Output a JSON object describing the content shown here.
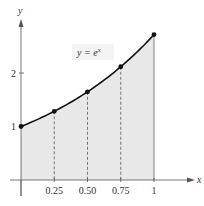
{
  "chart_data": {
    "type": "area",
    "title": "",
    "function_label": "y = e^x",
    "label_parts": {
      "lhs": "y = e",
      "sup": "x"
    },
    "xlabel": "x",
    "ylabel": "y",
    "x_ticks": [
      0.25,
      0.5,
      0.75,
      1
    ],
    "x_tick_labels": [
      "0.25",
      "0.50",
      "0.75",
      "1"
    ],
    "y_ticks": [
      1,
      2
    ],
    "y_tick_labels": [
      "1",
      "2"
    ],
    "xlim": [
      0,
      1.15
    ],
    "ylim": [
      0,
      3
    ],
    "points": [
      {
        "x": 0,
        "y": 1.0
      },
      {
        "x": 0.25,
        "y": 1.284
      },
      {
        "x": 0.5,
        "y": 1.649
      },
      {
        "x": 0.75,
        "y": 2.117
      },
      {
        "x": 1,
        "y": 2.718
      }
    ],
    "shaded_region": {
      "from_x": 0,
      "to_x": 1,
      "under": "y = e^x"
    },
    "dashed_verticals_at": [
      0.25,
      0.5,
      0.75
    ],
    "grid": false,
    "colors": {
      "curve": "#111111",
      "fill": "#e6e6e6",
      "axis": "#555555"
    }
  }
}
